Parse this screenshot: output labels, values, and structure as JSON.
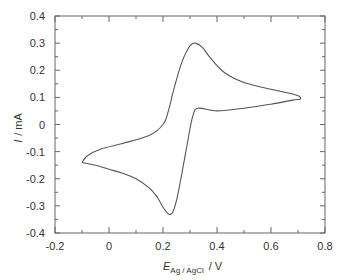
{
  "chart_data": {
    "type": "line",
    "title": "",
    "xlabel": "E_Ag/AgCl / V",
    "xlabel_main": "E",
    "xlabel_sub": "Ag / AgCl",
    "xlabel_unit": "/  V",
    "ylabel": "I / mA",
    "ylabel_main": "I",
    "ylabel_unit": "/ mA",
    "xlim": [
      -0.2,
      0.8
    ],
    "ylim": [
      -0.4,
      0.4
    ],
    "xticks": [
      -0.2,
      0,
      0.2,
      0.4,
      0.6,
      0.8
    ],
    "xtick_labels": [
      "-0.2",
      "0",
      "0.2",
      "0.4",
      "0.6",
      "0.8"
    ],
    "yticks": [
      -0.4,
      -0.3,
      -0.2,
      -0.1,
      0,
      0.1,
      0.2,
      0.3,
      0.4
    ],
    "ytick_labels": [
      "-0.4",
      "-0.3",
      "-0.2",
      "-0.1",
      "0",
      "0.1",
      "0.2",
      "0.3",
      "0.4"
    ],
    "grid": false,
    "legend": null,
    "series": [
      {
        "name": "cyclic voltammogram",
        "color": "#555555",
        "points": [
          [
            -0.1,
            -0.14
          ],
          [
            -0.05,
            -0.15
          ],
          [
            0.0,
            -0.165
          ],
          [
            0.05,
            -0.18
          ],
          [
            0.1,
            -0.2
          ],
          [
            0.15,
            -0.235
          ],
          [
            0.18,
            -0.27
          ],
          [
            0.2,
            -0.305
          ],
          [
            0.22,
            -0.33
          ],
          [
            0.235,
            -0.325
          ],
          [
            0.25,
            -0.28
          ],
          [
            0.27,
            -0.18
          ],
          [
            0.29,
            -0.07
          ],
          [
            0.31,
            0.03
          ],
          [
            0.33,
            0.06
          ],
          [
            0.4,
            0.05
          ],
          [
            0.5,
            0.06
          ],
          [
            0.6,
            0.075
          ],
          [
            0.68,
            0.09
          ],
          [
            0.71,
            0.095
          ],
          [
            0.69,
            0.11
          ],
          [
            0.6,
            0.13
          ],
          [
            0.5,
            0.155
          ],
          [
            0.43,
            0.19
          ],
          [
            0.38,
            0.24
          ],
          [
            0.345,
            0.285
          ],
          [
            0.32,
            0.3
          ],
          [
            0.3,
            0.29
          ],
          [
            0.27,
            0.23
          ],
          [
            0.24,
            0.13
          ],
          [
            0.22,
            0.05
          ],
          [
            0.2,
            0.0
          ],
          [
            0.15,
            -0.04
          ],
          [
            0.05,
            -0.07
          ],
          [
            -0.03,
            -0.09
          ],
          [
            -0.08,
            -0.115
          ],
          [
            -0.1,
            -0.14
          ]
        ]
      }
    ]
  }
}
